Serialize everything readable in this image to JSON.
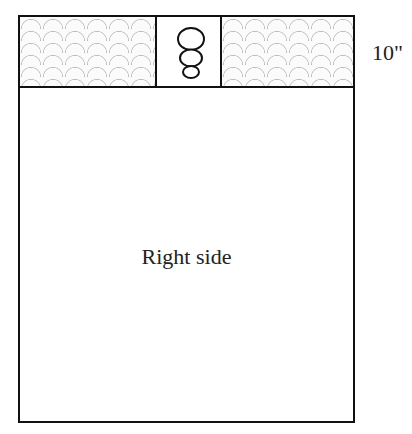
{
  "diagram": {
    "panel_label": "Right side",
    "band_height_label": "10\"",
    "center_motif": "snowman-applique-icon",
    "band_pattern": "scallop-dotted-fabric"
  }
}
